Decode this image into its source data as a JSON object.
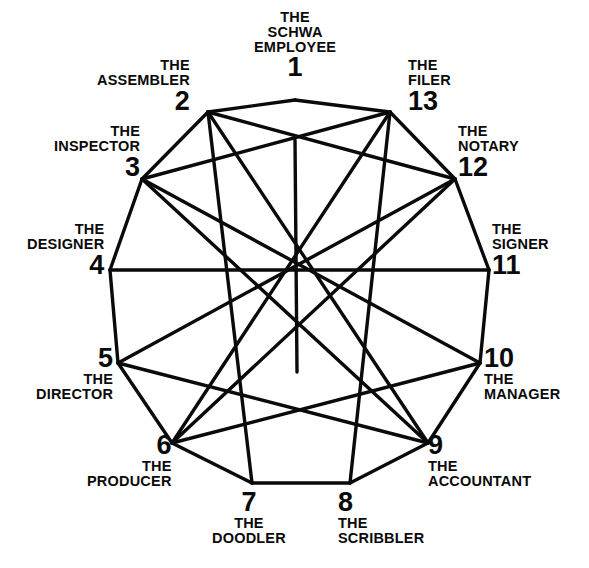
{
  "diagram": {
    "title_visible": false,
    "type": "13-point star polygon (enneagram-style)",
    "colors": {
      "background": "#ffffff",
      "stroke": "#0a0a0a",
      "text": "#0a0a0a"
    },
    "stroke_width": 3,
    "center": {
      "x": 295,
      "y": 268
    },
    "nodes": [
      {
        "id": 1,
        "number": "1",
        "name_line1": "THE",
        "name_line2": "SCHWA",
        "name_line3": "EMPLOYEE",
        "full_name": "THE SCHWA EMPLOYEE",
        "vertex": {
          "x": 295,
          "y": 100
        },
        "label": {
          "x": 295,
          "y": 10,
          "align": "center",
          "order": "name-first"
        }
      },
      {
        "id": 2,
        "number": "2",
        "name_line1": "THE",
        "name_line2": "ASSEMBLER",
        "full_name": "THE ASSEMBLER",
        "vertex": {
          "x": 208,
          "y": 112
        },
        "label": {
          "x": 190,
          "y": 58,
          "align": "right",
          "order": "name-first"
        }
      },
      {
        "id": 3,
        "number": "3",
        "name_line1": "THE",
        "name_line2": "INSPECTOR",
        "full_name": "THE INSPECTOR",
        "vertex": {
          "x": 142,
          "y": 179
        },
        "label": {
          "x": 140,
          "y": 124,
          "align": "right",
          "order": "name-first"
        }
      },
      {
        "id": 4,
        "number": "4",
        "name_line1": "THE",
        "name_line2": "DESIGNER",
        "full_name": "THE DESIGNER",
        "vertex": {
          "x": 110,
          "y": 270
        },
        "label": {
          "x": 104,
          "y": 222,
          "align": "right",
          "order": "name-first"
        }
      },
      {
        "id": 5,
        "number": "5",
        "name_line1": "THE",
        "name_line2": "DIRECTOR",
        "full_name": "THE DIRECTOR",
        "vertex": {
          "x": 118,
          "y": 363
        },
        "label": {
          "x": 113,
          "y": 345,
          "align": "right",
          "order": "number-first"
        }
      },
      {
        "id": 6,
        "number": "6",
        "name_line1": "THE",
        "name_line2": "PRODUCER",
        "full_name": "THE PRODUCER",
        "vertex": {
          "x": 172,
          "y": 443
        },
        "label": {
          "x": 172,
          "y": 432,
          "align": "right",
          "order": "number-first"
        }
      },
      {
        "id": 7,
        "number": "7",
        "name_line1": "THE",
        "name_line2": "DOODLER",
        "full_name": "THE DOODLER",
        "vertex": {
          "x": 252,
          "y": 483
        },
        "label": {
          "x": 249,
          "y": 489,
          "align": "center",
          "order": "number-first"
        }
      },
      {
        "id": 8,
        "number": "8",
        "name_line1": "THE",
        "name_line2": "SCRIBBLER",
        "full_name": "THE SCRIBBLER",
        "vertex": {
          "x": 350,
          "y": 483
        },
        "label": {
          "x": 338,
          "y": 489,
          "align": "left",
          "order": "number-first"
        }
      },
      {
        "id": 9,
        "number": "9",
        "name_line1": "THE",
        "name_line2": "ACCOUNTANT",
        "full_name": "THE ACCOUNTANT",
        "vertex": {
          "x": 428,
          "y": 443
        },
        "label": {
          "x": 428,
          "y": 432,
          "align": "left",
          "order": "number-first"
        }
      },
      {
        "id": 10,
        "number": "10",
        "name_line1": "THE",
        "name_line2": "MANAGER",
        "full_name": "THE MANAGER",
        "vertex": {
          "x": 480,
          "y": 363
        },
        "label": {
          "x": 484,
          "y": 345,
          "align": "left",
          "order": "number-first"
        }
      },
      {
        "id": 11,
        "number": "11",
        "name_line1": "THE",
        "name_line2": "SIGNER",
        "full_name": "THE SIGNER",
        "vertex": {
          "x": 489,
          "y": 270
        },
        "label": {
          "x": 492,
          "y": 222,
          "align": "left",
          "order": "name-first"
        }
      },
      {
        "id": 12,
        "number": "12",
        "name_line1": "THE",
        "name_line2": "NOTARY",
        "full_name": "THE NOTARY",
        "vertex": {
          "x": 455,
          "y": 179
        },
        "label": {
          "x": 458,
          "y": 124,
          "align": "left",
          "order": "name-first"
        }
      },
      {
        "id": 13,
        "number": "13",
        "name_line1": "THE",
        "name_line2": "FILER",
        "full_name": "THE FILER",
        "vertex": {
          "x": 390,
          "y": 112
        },
        "label": {
          "x": 408,
          "y": 58,
          "align": "left",
          "order": "name-first"
        }
      }
    ],
    "perimeter_edges": [
      [
        1,
        2
      ],
      [
        2,
        3
      ],
      [
        3,
        4
      ],
      [
        4,
        5
      ],
      [
        5,
        6
      ],
      [
        6,
        7
      ],
      [
        7,
        8
      ],
      [
        8,
        9
      ],
      [
        9,
        10
      ],
      [
        10,
        11
      ],
      [
        11,
        12
      ],
      [
        12,
        13
      ],
      [
        13,
        1
      ]
    ],
    "chords": [
      [
        2,
        12
      ],
      [
        3,
        13
      ],
      [
        3,
        10
      ],
      [
        4,
        11
      ],
      [
        5,
        12
      ],
      [
        6,
        13
      ],
      [
        2,
        9
      ],
      [
        2,
        7
      ],
      [
        13,
        8
      ],
      [
        5,
        9
      ],
      [
        6,
        10
      ],
      [
        3,
        9
      ],
      [
        6,
        12
      ]
    ],
    "center_spoke": {
      "from": {
        "x": 295,
        "y": 140
      },
      "to": {
        "x": 297,
        "y": 372
      }
    }
  }
}
